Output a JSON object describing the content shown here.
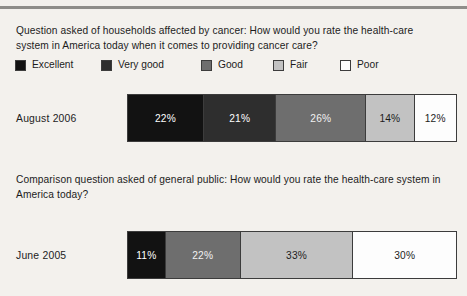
{
  "background_color": "#f3f1ed",
  "rule_color": "#8e8d89",
  "legend": {
    "items": [
      {
        "label": "Excellent",
        "color": "#121212",
        "shade": "excellent"
      },
      {
        "label": "Very good",
        "color": "#2e2e2e",
        "shade": "verygood"
      },
      {
        "label": "Good",
        "color": "#6e6e6e",
        "shade": "good"
      },
      {
        "label": "Fair",
        "color": "#c2c2c2",
        "shade": "fair"
      },
      {
        "label": "Poor",
        "color": "#fdfdfd",
        "shade": "poor"
      }
    ]
  },
  "question_1": {
    "text": "Question asked of households affected by cancer: How would you rate the health-care system in America today when it comes to providing cancer care?"
  },
  "question_2": {
    "text": "Comparison question asked of general public: How would you rate the health-care system in America today?"
  },
  "row_1": {
    "label": "August 2006"
  },
  "row_2": {
    "label": "June 2005"
  },
  "chart_data": [
    {
      "type": "bar",
      "orientation": "horizontal",
      "stacked": true,
      "title": "Question asked of households affected by cancer: How would you rate the health-care system in America today when it comes to providing cancer care?",
      "categories": [
        "August 2006"
      ],
      "xlabel": "",
      "ylabel": "",
      "xlim": [
        0,
        100
      ],
      "grid": false,
      "legend_position": "top",
      "series": [
        {
          "name": "Excellent",
          "values": [
            22
          ],
          "label": "22%",
          "color": "#121212",
          "shade": "excellent"
        },
        {
          "name": "Very good",
          "values": [
            21
          ],
          "label": "21%",
          "color": "#2e2e2e",
          "shade": "verygood"
        },
        {
          "name": "Good",
          "values": [
            26
          ],
          "label": "26%",
          "color": "#6e6e6e",
          "shade": "good"
        },
        {
          "name": "Fair",
          "values": [
            14
          ],
          "label": "14%",
          "color": "#c2c2c2",
          "shade": "fair"
        },
        {
          "name": "Poor",
          "values": [
            12
          ],
          "label": "12%",
          "color": "#fdfdfd",
          "shade": "poor"
        }
      ]
    },
    {
      "type": "bar",
      "orientation": "horizontal",
      "stacked": true,
      "title": "Comparison question asked of general public: How would you rate the health-care system in America today?",
      "categories": [
        "June 2005"
      ],
      "xlabel": "",
      "ylabel": "",
      "xlim": [
        0,
        100
      ],
      "grid": false,
      "legend_position": "top",
      "series": [
        {
          "name": "Excellent",
          "values": [
            11
          ],
          "label": "11%",
          "color": "#121212",
          "shade": "excellent"
        },
        {
          "name": "Good",
          "values": [
            22
          ],
          "label": "22%",
          "color": "#6e6e6e",
          "shade": "good"
        },
        {
          "name": "Fair",
          "values": [
            33
          ],
          "label": "33%",
          "color": "#c2c2c2",
          "shade": "fair"
        },
        {
          "name": "Poor",
          "values": [
            30
          ],
          "label": "30%",
          "color": "#fdfdfd",
          "shade": "poor"
        }
      ]
    }
  ]
}
